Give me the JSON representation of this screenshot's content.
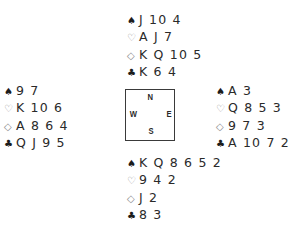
{
  "suit_symbols": {
    "spades": "♠",
    "hearts": "♡",
    "diamonds": "◇",
    "clubs": "♣"
  },
  "hands": {
    "north": {
      "spades": "J 10 4",
      "hearts": "A J 7",
      "diamonds": "K Q 10 5",
      "clubs": "K 6 4"
    },
    "west": {
      "spades": "9 7",
      "hearts": "K 10 6",
      "diamonds": "A 8 6 4",
      "clubs": "Q J 9 5"
    },
    "east": {
      "spades": "A 3",
      "hearts": "Q 8 5 3",
      "diamonds": "9 7 3",
      "clubs": "A 10 7 2"
    },
    "south": {
      "spades": "K Q 8 6 5 2",
      "hearts": "9 4 2",
      "diamonds": "J 2",
      "clubs": "8 3"
    }
  },
  "compass": {
    "north": "N",
    "south": "S",
    "west": "W",
    "east": "E"
  }
}
